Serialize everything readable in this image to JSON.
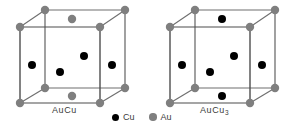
{
  "figure": {
    "background_color": "#ffffff",
    "colors": {
      "cu_atom": "#000000",
      "au_atom": "#7f7f7f",
      "edge_front": "#4d4d4d",
      "edge_back": "#6e6e6e",
      "text": "#3b3b3b"
    },
    "atom_radius": {
      "cu": 4.0,
      "au": 4.2,
      "legend": 3.6
    }
  },
  "cells": [
    {
      "id": "aucu",
      "label": "AuCu",
      "label_main": "AuCu",
      "label_sub": "",
      "origin_x": 0,
      "vertices": {
        "front_top_left": [
          20,
          27
        ],
        "front_top_right": [
          100,
          27
        ],
        "front_bottom_left": [
          20,
          103
        ],
        "front_bottom_right": [
          100,
          103
        ],
        "back_top_left": [
          45,
          10
        ],
        "back_top_right": [
          125,
          10
        ],
        "back_bottom_left": [
          45,
          88
        ],
        "back_bottom_right": [
          125,
          88
        ]
      },
      "corner_atoms": {
        "element": "Au",
        "color": "#7f7f7f",
        "count": 8
      },
      "interior_atoms": [
        {
          "element": "Cu",
          "site": "left-face-center",
          "x": 32,
          "y": 65,
          "color": "#000000"
        },
        {
          "element": "Cu",
          "site": "front-face-center",
          "x": 60,
          "y": 72,
          "color": "#000000"
        },
        {
          "element": "Cu",
          "site": "back-face-center",
          "x": 84,
          "y": 56,
          "color": "#000000"
        },
        {
          "element": "Cu",
          "site": "right-face-center",
          "x": 112,
          "y": 65,
          "color": "#000000"
        },
        {
          "element": "Au",
          "site": "top-face-center",
          "x": 72,
          "y": 19,
          "color": "#7f7f7f"
        },
        {
          "element": "Au",
          "site": "bottom-face-center",
          "x": 72,
          "y": 96,
          "color": "#7f7f7f"
        }
      ]
    },
    {
      "id": "aucu3",
      "label": "AuCu3",
      "label_main": "AuCu",
      "label_sub": "3",
      "origin_x": 150,
      "vertices": {
        "front_top_left": [
          170,
          27
        ],
        "front_top_right": [
          250,
          27
        ],
        "front_bottom_left": [
          170,
          103
        ],
        "front_bottom_right": [
          250,
          103
        ],
        "back_top_left": [
          195,
          10
        ],
        "back_top_right": [
          275,
          10
        ],
        "back_bottom_left": [
          195,
          88
        ],
        "back_bottom_right": [
          275,
          88
        ]
      },
      "corner_atoms": {
        "element": "Au",
        "color": "#7f7f7f",
        "count": 8
      },
      "interior_atoms": [
        {
          "element": "Cu",
          "site": "left-face-center",
          "x": 182,
          "y": 65,
          "color": "#000000"
        },
        {
          "element": "Cu",
          "site": "front-face-center",
          "x": 210,
          "y": 72,
          "color": "#000000"
        },
        {
          "element": "Cu",
          "site": "back-face-center",
          "x": 234,
          "y": 56,
          "color": "#000000"
        },
        {
          "element": "Cu",
          "site": "right-face-center",
          "x": 262,
          "y": 65,
          "color": "#000000"
        },
        {
          "element": "Cu",
          "site": "top-face-center",
          "x": 222,
          "y": 19,
          "color": "#000000"
        },
        {
          "element": "Cu",
          "site": "bottom-face-center",
          "x": 222,
          "y": 96,
          "color": "#000000"
        }
      ]
    }
  ],
  "labels": {
    "left_cell": {
      "text": "AuCu",
      "x": 52,
      "y": 112
    },
    "right_cell": {
      "text": "AuCu3",
      "x": 200,
      "y": 112
    }
  },
  "legend": {
    "items": [
      {
        "label": "Cu",
        "element": "Cu",
        "color": "#000000",
        "dot_x": 116,
        "dot_y": 117,
        "text_x": 123
      },
      {
        "label": "Au",
        "element": "Au",
        "color": "#7f7f7f",
        "dot_x": 153,
        "dot_y": 117,
        "text_x": 160
      }
    ]
  }
}
